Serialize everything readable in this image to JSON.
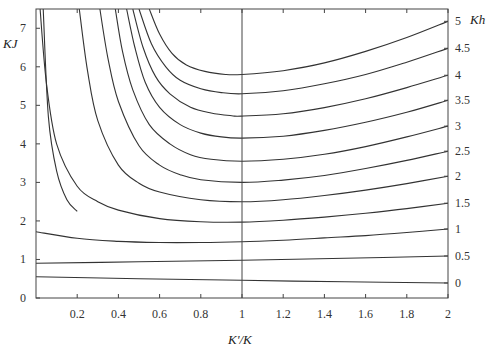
{
  "chart_data": {
    "type": "line",
    "title": "",
    "xlabel": "K'/K",
    "ylabel": "KJ",
    "y2label": "Kh",
    "xlim": [
      0,
      2
    ],
    "ylim": [
      0,
      7.5
    ],
    "grid": false,
    "x_ticks": [
      {
        "value": 0.2,
        "label": "0.2"
      },
      {
        "value": 0.4,
        "label": "0.4"
      },
      {
        "value": 0.6,
        "label": "0.6"
      },
      {
        "value": 0.8,
        "label": "0.8"
      },
      {
        "value": 1.0,
        "label": "1"
      },
      {
        "value": 1.2,
        "label": "1.2"
      },
      {
        "value": 1.4,
        "label": "1.4"
      },
      {
        "value": 1.6,
        "label": "1.6"
      },
      {
        "value": 1.8,
        "label": "1.8"
      },
      {
        "value": 2.0,
        "label": "2"
      }
    ],
    "y_ticks": [
      {
        "value": 0,
        "label": "0"
      },
      {
        "value": 1,
        "label": "1"
      },
      {
        "value": 2,
        "label": "2"
      },
      {
        "value": 3,
        "label": "3"
      },
      {
        "value": 4,
        "label": "4"
      },
      {
        "value": 5,
        "label": "5"
      },
      {
        "value": 6,
        "label": "6"
      },
      {
        "value": 7,
        "label": "7"
      }
    ],
    "y2_ticks": [
      {
        "label": "0",
        "kj": 0.39
      },
      {
        "label": "0.5",
        "kj": 1.09
      },
      {
        "label": "1",
        "kj": 1.79
      },
      {
        "label": "1.5",
        "kj": 2.46
      },
      {
        "label": "2",
        "kj": 3.16
      },
      {
        "label": "2.5",
        "kj": 3.81
      },
      {
        "label": "3",
        "kj": 4.46
      },
      {
        "label": "3.5",
        "kj": 5.13
      },
      {
        "label": "4",
        "kj": 5.78
      },
      {
        "label": "4.5",
        "kj": 6.48
      },
      {
        "label": "5",
        "kj": 7.18
      }
    ],
    "reference_line": {
      "x": 1.0,
      "orientation": "vertical"
    },
    "series": [
      {
        "name": "Kh=0",
        "x": [
          0.0,
          0.5,
          1.0,
          1.5,
          2.0
        ],
        "y": [
          0.55,
          0.5,
          0.46,
          0.42,
          0.39
        ]
      },
      {
        "name": "Kh=0.5",
        "x": [
          0.0,
          0.5,
          1.0,
          1.5,
          2.0
        ],
        "y": [
          0.9,
          0.94,
          0.98,
          1.03,
          1.09
        ]
      },
      {
        "name": "Kh=1",
        "x": [
          0.0,
          0.2,
          0.4,
          0.6,
          0.8,
          1.0,
          1.2,
          1.4,
          1.6,
          1.8,
          2.0
        ],
        "y": [
          1.72,
          1.55,
          1.47,
          1.44,
          1.44,
          1.46,
          1.5,
          1.56,
          1.62,
          1.7,
          1.79
        ]
      },
      {
        "name": "Kh=1.5",
        "x": [
          0.02,
          0.05,
          0.1,
          0.2,
          0.3,
          0.4,
          0.6,
          0.8,
          1.0,
          1.2,
          1.4,
          1.6,
          1.8,
          2.0
        ],
        "y": [
          7.5,
          5.6,
          4.0,
          2.9,
          2.5,
          2.28,
          2.06,
          1.98,
          1.97,
          2.02,
          2.1,
          2.2,
          2.32,
          2.46
        ]
      },
      {
        "name": "Kh=2",
        "x": [
          0.21,
          0.25,
          0.3,
          0.4,
          0.5,
          0.6,
          0.8,
          1.0,
          1.2,
          1.4,
          1.6,
          1.8,
          2.0
        ],
        "y": [
          7.5,
          5.9,
          4.6,
          3.45,
          2.98,
          2.75,
          2.55,
          2.5,
          2.55,
          2.66,
          2.8,
          2.97,
          3.16
        ]
      },
      {
        "name": "Kh=2.5",
        "x": [
          0.31,
          0.35,
          0.4,
          0.5,
          0.6,
          0.7,
          0.8,
          1.0,
          1.2,
          1.4,
          1.6,
          1.8,
          2.0
        ],
        "y": [
          7.5,
          6.2,
          5.1,
          3.95,
          3.45,
          3.2,
          3.07,
          3.0,
          3.06,
          3.18,
          3.36,
          3.57,
          3.81
        ]
      },
      {
        "name": "Kh=3",
        "x": [
          0.385,
          0.42,
          0.47,
          0.55,
          0.65,
          0.75,
          0.85,
          1.0,
          1.2,
          1.4,
          1.6,
          1.8,
          2.0
        ],
        "y": [
          7.5,
          6.4,
          5.4,
          4.5,
          4.0,
          3.72,
          3.6,
          3.55,
          3.6,
          3.73,
          3.93,
          4.18,
          4.46
        ]
      },
      {
        "name": "Kh=3.5",
        "x": [
          0.44,
          0.48,
          0.53,
          0.6,
          0.7,
          0.8,
          0.9,
          1.0,
          1.2,
          1.4,
          1.6,
          1.8,
          2.0
        ],
        "y": [
          7.5,
          6.5,
          5.6,
          4.95,
          4.5,
          4.28,
          4.18,
          4.15,
          4.2,
          4.35,
          4.56,
          4.82,
          5.13
        ]
      },
      {
        "name": "Kh=4",
        "x": [
          0.47,
          0.52,
          0.58,
          0.65,
          0.75,
          0.85,
          0.95,
          1.0,
          1.2,
          1.4,
          1.6,
          1.8,
          2.0
        ],
        "y": [
          7.5,
          6.5,
          5.75,
          5.3,
          4.95,
          4.8,
          4.73,
          4.72,
          4.78,
          4.94,
          5.17,
          5.46,
          5.78
        ]
      },
      {
        "name": "Kh=4.5",
        "x": [
          0.5,
          0.56,
          0.63,
          0.7,
          0.8,
          0.9,
          1.0,
          1.2,
          1.4,
          1.6,
          1.8,
          2.0
        ],
        "y": [
          7.5,
          6.6,
          6.0,
          5.65,
          5.43,
          5.33,
          5.3,
          5.38,
          5.56,
          5.8,
          6.12,
          6.48
        ]
      },
      {
        "name": "Kh=5",
        "x": [
          0.55,
          0.6,
          0.66,
          0.73,
          0.82,
          0.92,
          1.0,
          1.2,
          1.4,
          1.6,
          1.8,
          2.0
        ],
        "y": [
          7.5,
          6.85,
          6.35,
          6.05,
          5.88,
          5.8,
          5.8,
          5.9,
          6.1,
          6.4,
          6.76,
          7.18
        ]
      },
      {
        "name": "Kh-left-1",
        "x": [
          0.035,
          0.06,
          0.1,
          0.15,
          0.2
        ],
        "y": [
          7.5,
          4.7,
          3.3,
          2.55,
          2.25
        ]
      }
    ]
  }
}
